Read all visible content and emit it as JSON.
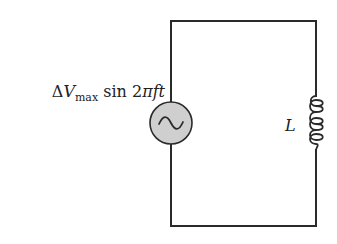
{
  "diagram": {
    "type": "circuit",
    "title": "",
    "components": [
      {
        "id": "source",
        "kind": "ac-voltage-source",
        "icon": "ac-source-icon",
        "label": {
          "delta": "Δ",
          "symbol": "V",
          "subscript": "max",
          "function": " sin 2",
          "pi": "π",
          "vars": "ft"
        },
        "fill_color": "#cfcfcf"
      },
      {
        "id": "inductor",
        "kind": "inductor",
        "icon": "inductor-coil-icon",
        "label": "L",
        "turns": 4
      }
    ],
    "wire_color": "#2a2a2a",
    "background": "#ffffff"
  }
}
